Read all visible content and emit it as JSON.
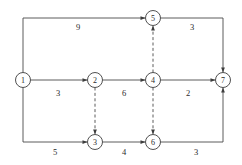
{
  "diagram": {
    "type": "directed-network",
    "nodes": [
      {
        "id": "1",
        "label": "1",
        "x": 23,
        "y": 80,
        "r": 7.5
      },
      {
        "id": "2",
        "label": "2",
        "x": 95,
        "y": 80,
        "r": 7.5
      },
      {
        "id": "3",
        "label": "3",
        "x": 95,
        "y": 142,
        "r": 7.5
      },
      {
        "id": "4",
        "label": "4",
        "x": 153,
        "y": 80,
        "r": 7.5
      },
      {
        "id": "5",
        "label": "5",
        "x": 153,
        "y": 18,
        "r": 7.5
      },
      {
        "id": "6",
        "label": "6",
        "x": 153,
        "y": 142,
        "r": 7.5
      },
      {
        "id": "7",
        "label": "7",
        "x": 223,
        "y": 80,
        "r": 7.5
      }
    ],
    "edges": [
      {
        "id": "e-1-5",
        "from": "1",
        "to": "5",
        "weight": "9",
        "style": "solid",
        "route": "top-rail",
        "label_x": 78,
        "label_y": 27
      },
      {
        "id": "e-5-7",
        "from": "5",
        "to": "7",
        "weight": "3",
        "style": "solid",
        "route": "top-rail",
        "label_x": 192,
        "label_y": 27
      },
      {
        "id": "e-1-2",
        "from": "1",
        "to": "2",
        "weight": "3",
        "style": "solid",
        "route": "straight",
        "label_x": 58,
        "label_y": 93
      },
      {
        "id": "e-2-4",
        "from": "2",
        "to": "4",
        "weight": "6",
        "style": "solid",
        "route": "straight",
        "label_x": 124,
        "label_y": 93
      },
      {
        "id": "e-4-7",
        "from": "4",
        "to": "7",
        "weight": "2",
        "style": "solid",
        "route": "straight",
        "label_x": 188,
        "label_y": 93
      },
      {
        "id": "e-1-3",
        "from": "1",
        "to": "3",
        "weight": "5",
        "style": "solid",
        "route": "bottom-rail",
        "label_x": 55,
        "label_y": 152
      },
      {
        "id": "e-3-6",
        "from": "3",
        "to": "6",
        "weight": "4",
        "style": "solid",
        "route": "straight",
        "label_x": 124,
        "label_y": 152
      },
      {
        "id": "e-6-7",
        "from": "6",
        "to": "7",
        "weight": "3",
        "style": "solid",
        "route": "bottom-rail",
        "label_x": 196,
        "label_y": 152
      },
      {
        "id": "e-4-5",
        "from": "4",
        "to": "5",
        "weight": "",
        "style": "dashed",
        "route": "vertical-up",
        "label_x": 0,
        "label_y": 0
      },
      {
        "id": "e-2-3",
        "from": "2",
        "to": "3",
        "weight": "",
        "style": "dashed",
        "route": "vertical-down",
        "label_x": 0,
        "label_y": 0
      },
      {
        "id": "e-4-6",
        "from": "4",
        "to": "6",
        "weight": "",
        "style": "dashed",
        "route": "vertical-down",
        "label_x": 0,
        "label_y": 0
      }
    ],
    "rails": {
      "top_y": 18,
      "bottom_y": 142,
      "left_x": 23,
      "right_x": 223
    },
    "colors": {
      "line": "#4a4a4a",
      "node_stroke": "#3d3d3d",
      "node_fill": "#ffffff",
      "text": "#2b2b2b",
      "background": "#ffffff"
    }
  }
}
